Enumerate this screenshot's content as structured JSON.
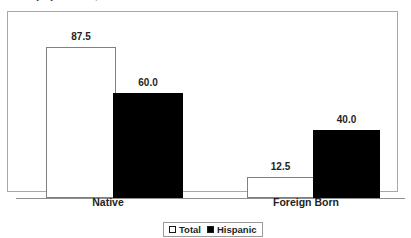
{
  "title_fragment": "population, 2000",
  "chart_data": {
    "type": "bar",
    "title": "",
    "xlabel": "",
    "ylabel": "",
    "ylim": [
      0,
      100
    ],
    "grid": false,
    "legend_position": "bottom-center",
    "categories": [
      "Native",
      "Foreign Born"
    ],
    "series": [
      {
        "name": "Total",
        "values": [
          87.5,
          12.5
        ],
        "color": "#ffffff"
      },
      {
        "name": "Hispanic",
        "values": [
          60.0,
          40.0
        ],
        "color": "#000000"
      }
    ],
    "data_labels": {
      "native_total": "87.5",
      "native_hispanic": "60.0",
      "foreign_total": "12.5",
      "foreign_hispanic": "40.0"
    }
  },
  "axis": {
    "categories": [
      {
        "label": "Native"
      },
      {
        "label": "Foreign Born"
      }
    ]
  },
  "legend": {
    "items": [
      {
        "label": "Total",
        "swatch": "white-square-icon"
      },
      {
        "label": "Hispanic",
        "swatch": "black-square-icon"
      }
    ]
  }
}
